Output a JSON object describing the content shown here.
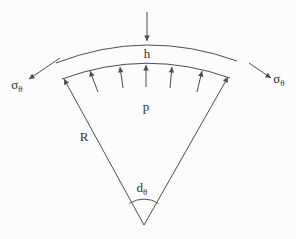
{
  "figure": {
    "description_labels_only": "curved shell element sector diagram",
    "colors": {
      "background": "#fcfcfc",
      "line": "#4d4d4d",
      "text": "#333333"
    },
    "labels": {
      "thickness": "h",
      "pressure": "p",
      "radius": "R",
      "angle_main": "d",
      "angle_sub": "θ",
      "hoop_left_main": "σ",
      "hoop_left_sub": "θ",
      "hoop_right_main": "σ",
      "hoop_right_sub": "θ"
    }
  }
}
